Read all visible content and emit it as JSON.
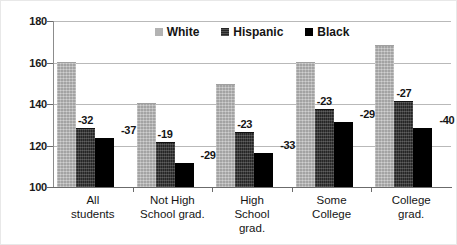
{
  "chart_data": {
    "type": "bar",
    "title": "",
    "subtitle": "",
    "xlabel": "",
    "ylabel": "",
    "ylim": [
      100,
      180
    ],
    "yticks": [
      100,
      120,
      140,
      160,
      180
    ],
    "ytick_labels": [
      "100",
      "120",
      "140",
      "160",
      "180"
    ],
    "grid": true,
    "legend_position": "top-center",
    "categories": [
      "All students",
      "Not High School grad.",
      "High School grad.",
      "Some College",
      "College grad."
    ],
    "category_lines": [
      [
        "All",
        "students"
      ],
      [
        "Not High",
        "School grad."
      ],
      [
        "High",
        "School",
        "grad."
      ],
      [
        "Some",
        "College"
      ],
      [
        "College",
        "grad."
      ]
    ],
    "series": [
      {
        "name": "White",
        "color": "#b3b3b3",
        "values": [
          160,
          140,
          149,
          160,
          168
        ],
        "labels": [
          "",
          "",
          "",
          "",
          ""
        ]
      },
      {
        "name": "Hispanic",
        "color": "#262626",
        "values": [
          128,
          121,
          126,
          137,
          141
        ],
        "labels": [
          "-32",
          "-19",
          "-23",
          "-23",
          "-27"
        ]
      },
      {
        "name": "Black",
        "color": "#000000",
        "values": [
          123,
          111,
          116,
          131,
          128
        ],
        "labels": [
          "-37",
          "-29",
          "-33",
          "-29",
          "-40"
        ]
      }
    ]
  },
  "legend": {
    "items": [
      {
        "label": "White"
      },
      {
        "label": "Hispanic"
      },
      {
        "label": "Black"
      }
    ]
  }
}
